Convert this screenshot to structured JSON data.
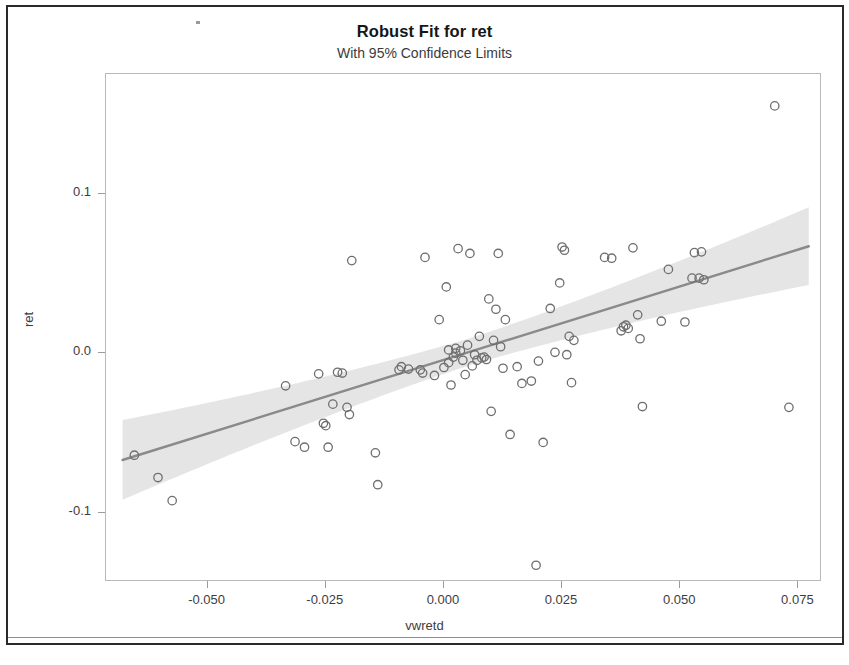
{
  "document": {
    "border_color": "#2a2a2a",
    "background": "#ffffff"
  },
  "chart_data": {
    "type": "scatter",
    "title": "Robust Fit for ret",
    "subtitle": "With 95% Confidence Limits",
    "xlabel": "vwretd",
    "ylabel": "ret",
    "xlim": [
      -0.0715,
      0.08
    ],
    "ylim": [
      -0.1435,
      0.175
    ],
    "grid": false,
    "legend": null,
    "marker": {
      "shape": "open-circle",
      "edge_color": "#6e6e6e",
      "fill": "none",
      "radius": 4.2
    },
    "fit_line": {
      "name": "Robust fit",
      "color": "#8a8a8a",
      "width": 2.4,
      "intercept": -0.0042,
      "slope": 0.9228,
      "x_start": -0.068,
      "x_end": 0.0772,
      "y_start": -0.067,
      "y_end": 0.067
    },
    "confidence_band": {
      "name": "95% Confidence Limits",
      "level": 95,
      "fill_color": "#e3e3e3",
      "half_width_at_center": 0.0085,
      "half_width_at_edges": 0.025,
      "center_x": 0.0055
    },
    "x": [
      -0.0655,
      -0.0605,
      -0.0575,
      -0.0335,
      -0.0315,
      -0.0295,
      -0.0265,
      -0.0255,
      -0.025,
      -0.0245,
      -0.0235,
      -0.0225,
      -0.0215,
      -0.0205,
      -0.02,
      -0.0195,
      -0.0145,
      -0.014,
      -0.0095,
      -0.009,
      -0.0075,
      -0.005,
      -0.0045,
      -0.004,
      -0.002,
      -0.001,
      0.0,
      0.0005,
      0.001,
      0.001,
      0.0015,
      0.002,
      0.0025,
      0.0025,
      0.003,
      0.0035,
      0.004,
      0.0045,
      0.005,
      0.0055,
      0.006,
      0.0065,
      0.007,
      0.0075,
      0.008,
      0.0085,
      0.009,
      0.0095,
      0.01,
      0.0105,
      0.011,
      0.0115,
      0.012,
      0.0125,
      0.013,
      0.014,
      0.0155,
      0.0165,
      0.0185,
      0.0195,
      0.02,
      0.021,
      0.0225,
      0.0235,
      0.0245,
      0.025,
      0.0255,
      0.026,
      0.0265,
      0.027,
      0.0275,
      0.034,
      0.0355,
      0.0375,
      0.038,
      0.0385,
      0.039,
      0.04,
      0.041,
      0.0415,
      0.042,
      0.046,
      0.0475,
      0.051,
      0.0525,
      0.053,
      0.054,
      0.0545,
      0.055,
      0.07,
      0.073
    ],
    "y": [
      -0.064,
      -0.078,
      -0.0925,
      -0.0205,
      -0.0555,
      -0.059,
      -0.013,
      -0.044,
      -0.0455,
      -0.059,
      -0.032,
      -0.012,
      -0.0125,
      -0.034,
      -0.0385,
      0.058,
      -0.0625,
      -0.0825,
      -0.0105,
      -0.0085,
      -0.01,
      -0.0105,
      -0.0125,
      0.06,
      -0.014,
      0.021,
      -0.009,
      0.0415,
      -0.006,
      0.002,
      -0.02,
      -0.0025,
      0.0,
      0.003,
      0.0655,
      0.0015,
      -0.0045,
      -0.0135,
      0.005,
      0.0625,
      -0.008,
      -0.001,
      -0.0045,
      0.0105,
      -0.003,
      -0.0025,
      -0.004,
      0.034,
      -0.0365,
      0.008,
      0.0275,
      0.0625,
      0.004,
      -0.0095,
      0.021,
      -0.051,
      -0.0085,
      -0.019,
      -0.0175,
      -0.133,
      -0.005,
      -0.056,
      0.028,
      0.0005,
      0.044,
      0.0665,
      0.0645,
      -0.001,
      0.0105,
      -0.0185,
      0.008,
      0.06,
      0.0595,
      0.014,
      0.0165,
      0.0175,
      0.0155,
      0.066,
      0.024,
      0.009,
      -0.0335,
      0.02,
      0.0525,
      0.0195,
      0.047,
      0.063,
      0.047,
      0.0635,
      0.046,
      0.155,
      -0.034
    ],
    "x_ticks": [
      -0.05,
      -0.025,
      0.0,
      0.025,
      0.05,
      0.075
    ],
    "x_tick_labels": [
      "-0.050",
      "-0.025",
      "0.000",
      "0.025",
      "0.050",
      "0.075"
    ],
    "y_ticks": [
      0.1,
      0.0,
      -0.1
    ],
    "y_tick_labels": [
      "0.1",
      "0.0",
      "-0.1"
    ]
  }
}
